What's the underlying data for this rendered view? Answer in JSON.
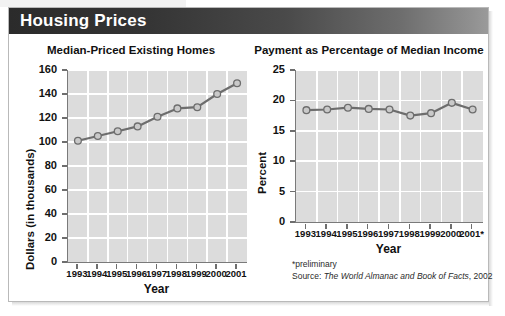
{
  "header": {
    "title": "Housing Prices"
  },
  "footnotes": {
    "preliminary": "*preliminary",
    "source_prefix": "Source: ",
    "source_italic": "The World Almanac and Book of Facts",
    "source_suffix": ", 2002"
  },
  "colors": {
    "title_band_dark": "#2b2b2b",
    "title_band_light": "#9a9a9a",
    "plot_background": "#dcdcdc",
    "gridline": "#ffffff",
    "series_line": "#6d6d6d",
    "marker_fill": "#c9c9c9",
    "marker_stroke": "#6d6d6d",
    "axis": "#7a7a7a",
    "text": "#111111"
  },
  "chart_data": [
    {
      "type": "line",
      "id": "median-priced-existing-homes",
      "title": "Median-Priced Existing Homes",
      "xlabel": "Year",
      "ylabel": "Dollars (in thousands)",
      "categories": [
        "1993",
        "1994",
        "1995",
        "1996",
        "1997",
        "1998",
        "1999",
        "2000",
        "2001"
      ],
      "values": [
        101,
        105,
        109,
        113,
        121,
        128,
        129,
        140,
        149
      ],
      "ylim": [
        0,
        160
      ],
      "yticks": [
        0,
        20,
        40,
        60,
        80,
        100,
        120,
        140,
        160
      ],
      "ytick_labels": [
        "0",
        "20",
        "40",
        "60",
        "80",
        "100",
        "120",
        "140",
        "160"
      ],
      "grid": true,
      "legend": "none"
    },
    {
      "type": "line",
      "id": "payment-as-percentage-of-median-income",
      "title": "Payment as Percentage of Median Income",
      "xlabel": "Year",
      "ylabel": "Percent",
      "categories": [
        "1993",
        "1994",
        "1995",
        "1996",
        "1997",
        "1998",
        "1999",
        "2000",
        "2001*"
      ],
      "values": [
        18.4,
        18.5,
        18.8,
        18.6,
        18.5,
        17.5,
        17.9,
        19.6,
        18.5
      ],
      "ylim": [
        0,
        25
      ],
      "yticks": [
        0,
        5,
        10,
        15,
        20,
        25
      ],
      "ytick_labels": [
        "0",
        "5",
        "10",
        "15",
        "20",
        "25"
      ],
      "grid": true,
      "legend": "none"
    }
  ]
}
